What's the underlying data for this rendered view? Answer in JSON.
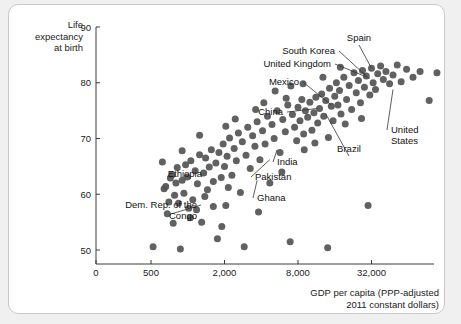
{
  "chart_data": {
    "type": "scatter",
    "title": "",
    "xlabel": "GDP per capita (PPP-adjusted 2011 constant dollars)",
    "ylabel": "Life expectancy at birth",
    "xscale": "log",
    "yscale": "linear",
    "xticks": [
      0,
      500,
      2000,
      8000,
      32000
    ],
    "xticklabels": [
      "0",
      "500",
      "2,000",
      "8,000",
      "32,000"
    ],
    "yticks": [
      50,
      60,
      70,
      80,
      90
    ],
    "yticklabels": [
      "50",
      "60",
      "70",
      "80",
      "90"
    ],
    "ylim": [
      46,
      90
    ],
    "grid": false,
    "legend": null,
    "marker_color": "#555555",
    "points": [
      {
        "x": 520,
        "y": 50.6
      },
      {
        "x": 640,
        "y": 61.0
      },
      {
        "x": 660,
        "y": 61.4
      },
      {
        "x": 680,
        "y": 56.5
      },
      {
        "x": 700,
        "y": 58.6
      },
      {
        "x": 720,
        "y": 62.9
      },
      {
        "x": 745,
        "y": 63.5
      },
      {
        "x": 760,
        "y": 54.8
      },
      {
        "x": 780,
        "y": 59.8
      },
      {
        "x": 800,
        "y": 62.0
      },
      {
        "x": 820,
        "y": 64.8
      },
      {
        "x": 840,
        "y": 58.4
      },
      {
        "x": 870,
        "y": 50.2
      },
      {
        "x": 900,
        "y": 62.5
      },
      {
        "x": 930,
        "y": 60.2
      },
      {
        "x": 960,
        "y": 65.3
      },
      {
        "x": 990,
        "y": 63.1
      },
      {
        "x": 1020,
        "y": 57.5
      },
      {
        "x": 1060,
        "y": 66.0
      },
      {
        "x": 1100,
        "y": 59.0
      },
      {
        "x": 1150,
        "y": 64.2
      },
      {
        "x": 1200,
        "y": 61.9
      },
      {
        "x": 1250,
        "y": 67.1
      },
      {
        "x": 1300,
        "y": 55.0
      },
      {
        "x": 1350,
        "y": 63.8
      },
      {
        "x": 1400,
        "y": 66.5
      },
      {
        "x": 1450,
        "y": 60.8
      },
      {
        "x": 1500,
        "y": 64.9
      },
      {
        "x": 1560,
        "y": 68.0
      },
      {
        "x": 1620,
        "y": 62.3
      },
      {
        "x": 1700,
        "y": 65.6
      },
      {
        "x": 1750,
        "y": 52.0
      },
      {
        "x": 1800,
        "y": 67.5
      },
      {
        "x": 1880,
        "y": 63.0
      },
      {
        "x": 1950,
        "y": 69.0
      },
      {
        "x": 2000,
        "y": 65.0
      },
      {
        "x": 2050,
        "y": 58.0
      },
      {
        "x": 2100,
        "y": 66.8
      },
      {
        "x": 2200,
        "y": 70.1
      },
      {
        "x": 2300,
        "y": 63.4
      },
      {
        "x": 2400,
        "y": 68.2
      },
      {
        "x": 2500,
        "y": 66.0
      },
      {
        "x": 2600,
        "y": 71.0
      },
      {
        "x": 2700,
        "y": 60.3
      },
      {
        "x": 2800,
        "y": 69.4
      },
      {
        "x": 2900,
        "y": 50.6
      },
      {
        "x": 3000,
        "y": 67.0
      },
      {
        "x": 3100,
        "y": 72.0
      },
      {
        "x": 3250,
        "y": 64.6
      },
      {
        "x": 3400,
        "y": 70.5
      },
      {
        "x": 3550,
        "y": 68.6
      },
      {
        "x": 3700,
        "y": 73.0
      },
      {
        "x": 3900,
        "y": 66.2
      },
      {
        "x": 4100,
        "y": 71.4
      },
      {
        "x": 4300,
        "y": 69.0
      },
      {
        "x": 4500,
        "y": 74.0
      },
      {
        "x": 4700,
        "y": 62.0
      },
      {
        "x": 4900,
        "y": 72.5
      },
      {
        "x": 5100,
        "y": 70.0
      },
      {
        "x": 5400,
        "y": 75.0
      },
      {
        "x": 5700,
        "y": 67.5
      },
      {
        "x": 6000,
        "y": 73.4
      },
      {
        "x": 6300,
        "y": 71.2
      },
      {
        "x": 6600,
        "y": 76.0
      },
      {
        "x": 6900,
        "y": 51.5
      },
      {
        "x": 7200,
        "y": 74.3
      },
      {
        "x": 7500,
        "y": 72.0
      },
      {
        "x": 7800,
        "y": 69.6
      },
      {
        "x": 8000,
        "y": 75.6
      },
      {
        "x": 8300,
        "y": 73.2
      },
      {
        "x": 8600,
        "y": 77.0
      },
      {
        "x": 8900,
        "y": 70.8
      },
      {
        "x": 9200,
        "y": 75.0
      },
      {
        "x": 9600,
        "y": 73.8
      },
      {
        "x": 10000,
        "y": 76.5
      },
      {
        "x": 10400,
        "y": 71.5
      },
      {
        "x": 10800,
        "y": 74.6
      },
      {
        "x": 11200,
        "y": 77.4
      },
      {
        "x": 11600,
        "y": 72.8
      },
      {
        "x": 12000,
        "y": 75.4
      },
      {
        "x": 12500,
        "y": 78.0
      },
      {
        "x": 13000,
        "y": 74.0
      },
      {
        "x": 13500,
        "y": 76.8
      },
      {
        "x": 14000,
        "y": 50.4
      },
      {
        "x": 14500,
        "y": 79.0
      },
      {
        "x": 15000,
        "y": 75.8
      },
      {
        "x": 15500,
        "y": 73.2
      },
      {
        "x": 16000,
        "y": 77.6
      },
      {
        "x": 16500,
        "y": 80.0
      },
      {
        "x": 17000,
        "y": 76.0
      },
      {
        "x": 17500,
        "y": 78.6
      },
      {
        "x": 18000,
        "y": 74.4
      },
      {
        "x": 19000,
        "y": 81.0
      },
      {
        "x": 20000,
        "y": 77.0
      },
      {
        "x": 21000,
        "y": 79.5
      },
      {
        "x": 22000,
        "y": 75.2
      },
      {
        "x": 23000,
        "y": 81.8
      },
      {
        "x": 24000,
        "y": 78.2
      },
      {
        "x": 25000,
        "y": 80.4
      },
      {
        "x": 26000,
        "y": 76.4
      },
      {
        "x": 27000,
        "y": 82.2
      },
      {
        "x": 28000,
        "y": 79.2
      },
      {
        "x": 29000,
        "y": 81.2
      },
      {
        "x": 30000,
        "y": 58.0
      },
      {
        "x": 31000,
        "y": 77.8
      },
      {
        "x": 32000,
        "y": 82.6
      },
      {
        "x": 33000,
        "y": 80.0
      },
      {
        "x": 34500,
        "y": 78.8
      },
      {
        "x": 36000,
        "y": 81.6
      },
      {
        "x": 38000,
        "y": 83.0
      },
      {
        "x": 40000,
        "y": 80.6
      },
      {
        "x": 42000,
        "y": 82.0
      },
      {
        "x": 45000,
        "y": 79.8
      },
      {
        "x": 48000,
        "y": 81.4
      },
      {
        "x": 52000,
        "y": 83.2
      },
      {
        "x": 56000,
        "y": 80.2
      },
      {
        "x": 62000,
        "y": 82.4
      },
      {
        "x": 70000,
        "y": 81.0
      },
      {
        "x": 80000,
        "y": 82.0
      },
      {
        "x": 95000,
        "y": 76.8
      },
      {
        "x": 110000,
        "y": 81.8
      },
      {
        "x": 1050,
        "y": 55.8
      },
      {
        "x": 1180,
        "y": 57.2
      },
      {
        "x": 1380,
        "y": 59.6
      },
      {
        "x": 1620,
        "y": 57.8
      },
      {
        "x": 2150,
        "y": 61.2
      },
      {
        "x": 2450,
        "y": 73.5
      },
      {
        "x": 3600,
        "y": 75.2
      },
      {
        "x": 5200,
        "y": 78.5
      },
      {
        "x": 7000,
        "y": 79.4
      },
      {
        "x": 9000,
        "y": 68.0
      },
      {
        "x": 11000,
        "y": 69.2
      },
      {
        "x": 14200,
        "y": 70.2
      },
      {
        "x": 19500,
        "y": 72.6
      },
      {
        "x": 26500,
        "y": 73.6
      },
      {
        "x": 1900,
        "y": 54.2
      },
      {
        "x": 3800,
        "y": 56.8
      },
      {
        "x": 900,
        "y": 67.8
      },
      {
        "x": 1250,
        "y": 70.6
      },
      {
        "x": 2050,
        "y": 72.2
      },
      {
        "x": 620,
        "y": 65.8
      },
      {
        "x": 4200,
        "y": 76.4
      },
      {
        "x": 6400,
        "y": 77.2
      },
      {
        "x": 8800,
        "y": 79.8
      },
      {
        "x": 12800,
        "y": 81.0
      },
      {
        "x": 17800,
        "y": 82.8
      },
      {
        "x": 5900,
        "y": 64.0
      }
    ],
    "annotations": [
      {
        "label": "Spain",
        "point": {
          "x": 32000,
          "y": 82.6
        }
      },
      {
        "label": "South Korea",
        "point": {
          "x": 29000,
          "y": 81.2
        }
      },
      {
        "label": "United Kingdom",
        "point": {
          "x": 31000,
          "y": 80.8
        }
      },
      {
        "label": "Mexico",
        "point": {
          "x": 15000,
          "y": 76.0
        }
      },
      {
        "label": "China",
        "point": {
          "x": 11600,
          "y": 75.4
        }
      },
      {
        "label": "United\nStates",
        "point": {
          "x": 48000,
          "y": 78.8
        }
      },
      {
        "label": "Brazil",
        "point": {
          "x": 13500,
          "y": 74.4
        }
      },
      {
        "label": "India",
        "point": {
          "x": 5400,
          "y": 68.0
        }
      },
      {
        "label": "Pakistan",
        "point": {
          "x": 4700,
          "y": 66.2
        }
      },
      {
        "label": "Ghana",
        "point": {
          "x": 3700,
          "y": 62.5
        }
      },
      {
        "label": "Ethiopia",
        "point": {
          "x": 1450,
          "y": 63.8
        }
      },
      {
        "label": "Dem. Rep. of the\nCongo",
        "point": {
          "x": 740,
          "y": 56.5
        }
      }
    ]
  },
  "axes": {
    "y_title": "Life\nexpectancy\nat birth",
    "x_title": "GDP per capita (PPP-adjusted\n2011 constant dollars)"
  }
}
